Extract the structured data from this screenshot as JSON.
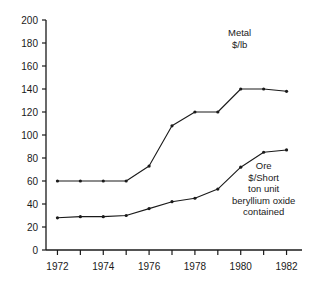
{
  "chart_data": {
    "type": "line",
    "title": "",
    "subtitle": "",
    "xlabel": "",
    "ylabel": "",
    "x": [
      1972,
      1973,
      1974,
      1975,
      1976,
      1977,
      1978,
      1979,
      1980,
      1981,
      1982
    ],
    "xlim": [
      1971.5,
      1982.5
    ],
    "ylim": [
      0,
      200
    ],
    "grid": false,
    "legend_position": "inline-annotation",
    "y_ticks": [
      0,
      20,
      40,
      60,
      80,
      100,
      120,
      140,
      160,
      180,
      200
    ],
    "y_tick_labels": [
      "0",
      "20",
      "40",
      "60",
      "80",
      "100",
      "120",
      "140",
      "160",
      "180",
      "200"
    ],
    "x_ticks": [
      1972,
      1973,
      1974,
      1975,
      1976,
      1977,
      1978,
      1979,
      1980,
      1981,
      1982
    ],
    "x_tick_labels": [
      "1972",
      "",
      "1974",
      "",
      "1976",
      "",
      "1978",
      "",
      "1980",
      "",
      "1982"
    ],
    "series": [
      {
        "name": "Metal $/lb",
        "color": "#1a1a1a",
        "marker": "dot",
        "values": [
          60,
          60,
          60,
          60,
          73,
          108,
          120,
          120,
          140,
          140,
          138
        ]
      },
      {
        "name": "Ore $/Short ton unit beryllium oxide contained",
        "color": "#1a1a1a",
        "marker": "dot",
        "values": [
          28,
          29,
          29,
          30,
          36,
          42,
          45,
          53,
          72,
          85,
          87
        ]
      }
    ],
    "annotations": [
      {
        "id": "metal",
        "lines": [
          "Metal",
          "$/lb"
        ],
        "anchor_x": 1979.3,
        "anchor_y": 182
      },
      {
        "id": "ore",
        "lines": [
          "Ore",
          "$/Short",
          "ton unit",
          "beryllium oxide",
          "contained"
        ],
        "anchor_x": 1979.6,
        "anchor_y": 78
      }
    ]
  }
}
